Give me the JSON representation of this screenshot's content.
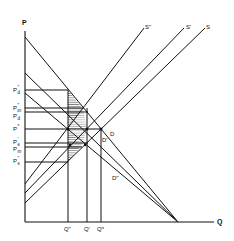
{
  "diagram": {
    "axes": {
      "y_label": "P",
      "x_label": "Q"
    },
    "supply_curves": [
      {
        "label": "S\"",
        "name": "S-double-prime"
      },
      {
        "label": "S'",
        "name": "S-prime"
      },
      {
        "label": "S",
        "name": "S"
      }
    ],
    "demand_curves": [
      {
        "label": "D",
        "name": "D"
      },
      {
        "label": "D'",
        "name": "D-prime"
      },
      {
        "label": "D\"",
        "name": "D-double-prime"
      }
    ],
    "price_labels": [
      {
        "main": "P",
        "sup": "\"",
        "sub": "d",
        "name": "P-d-double-prime"
      },
      {
        "main": "P",
        "sup": "\"",
        "sub": "m",
        "name": "P-m-double-prime"
      },
      {
        "main": "P",
        "sup": "'",
        "sub": "d",
        "name": "P-d-prime"
      },
      {
        "main": "P",
        "sup": "*",
        "sub": "",
        "name": "P-star"
      },
      {
        "main": "P",
        "sup": "'",
        "sub": "s",
        "name": "P-s-prime"
      },
      {
        "main": "P",
        "sup": "'",
        "sub": "m",
        "name": "P-m-prime"
      },
      {
        "main": "P",
        "sup": "\"",
        "sub": "s",
        "name": "P-s-double-prime"
      }
    ],
    "quantity_labels": [
      {
        "label": "Q\"",
        "name": "Q-double-prime"
      },
      {
        "label": "Q'",
        "name": "Q-prime"
      },
      {
        "label": "Q*",
        "name": "Q-star"
      }
    ],
    "colors": {
      "line": "#111111",
      "background": "#ffffff",
      "hatch": "#333333"
    }
  }
}
